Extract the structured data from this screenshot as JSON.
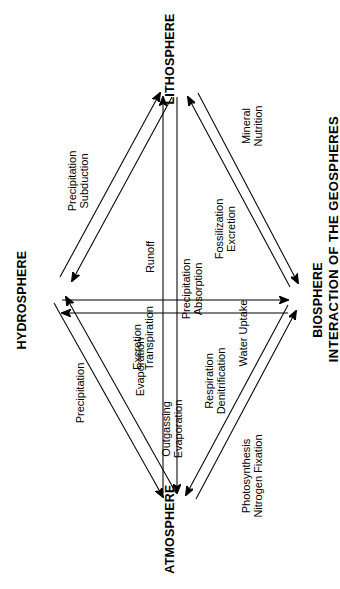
{
  "figure": {
    "caption": "INTERACTION OF THE GEOSPHERES",
    "orientation": "rotated-90-ccw",
    "background_color": "#ffffff",
    "ink_color": "#000000"
  },
  "nodes": [
    {
      "id": "atmosphere",
      "label": "ATMOSPHERE",
      "position": "left"
    },
    {
      "id": "hydrosphere",
      "label": "HYDROSPHERE",
      "position": "top"
    },
    {
      "id": "lithosphere",
      "label": "LITHOSPHERE",
      "position": "right"
    },
    {
      "id": "biosphere",
      "label": "BIOSPHERE",
      "position": "bottom"
    }
  ],
  "edge_labels": [
    {
      "id": "precipitation",
      "lines": [
        "Precipitation"
      ],
      "between": "hydrosphere-atmosphere"
    },
    {
      "id": "evaporation",
      "lines": [
        "Evaporation"
      ],
      "between": "atmosphere-hydrosphere"
    },
    {
      "id": "precipitation-subduction",
      "lines": [
        "Precipitation",
        "Subduction"
      ],
      "between": "hydrosphere-lithosphere"
    },
    {
      "id": "excretion-transpiration",
      "lines": [
        "Excretion",
        "Transpiration"
      ],
      "between": "biosphere-hydrosphere"
    },
    {
      "id": "runoff",
      "lines": [
        "Runoff"
      ],
      "between": "lithosphere-hydrosphere"
    },
    {
      "id": "precipitation-absorption",
      "lines": [
        "Precipitation",
        "Absorption"
      ],
      "between": "atmosphere-lithosphere"
    },
    {
      "id": "outgassing-evaporation",
      "lines": [
        "Outgassing",
        "Evaporation"
      ],
      "between": "lithosphere-atmosphere"
    },
    {
      "id": "respiration-denitrification",
      "lines": [
        "Respiration",
        "Denitrification"
      ],
      "between": "biosphere-atmosphere"
    },
    {
      "id": "photosynthesis-nitrogen-fixation",
      "lines": [
        "Photosynthesis",
        "Nitrogen Fixation"
      ],
      "between": "atmosphere-biosphere"
    },
    {
      "id": "water-uptake",
      "lines": [
        "Water Uptake"
      ],
      "between": "hydrosphere-biosphere"
    },
    {
      "id": "fossilization-excretion",
      "lines": [
        "Fossilization",
        "Excretion"
      ],
      "between": "biosphere-lithosphere"
    },
    {
      "id": "mineral-nutrition",
      "lines": [
        "Mineral",
        "Nutrition"
      ],
      "between": "lithosphere-biosphere"
    }
  ]
}
